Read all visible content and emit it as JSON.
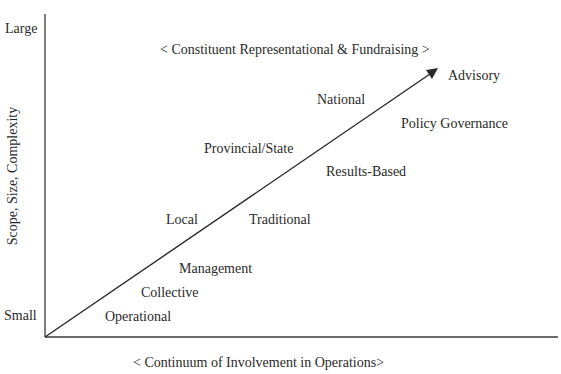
{
  "diagram": {
    "y_axis": {
      "label": "Scope, Size, Complexity",
      "top_label": "Large",
      "bottom_label": "Small"
    },
    "x_axis": {
      "label": "< Continuum of Involvement in Operations>"
    },
    "top_banner": "< Constituent Representational & Fundraising >",
    "arrow": {
      "from": "origin",
      "to": "upper-right",
      "color": "#2a2a2a"
    },
    "labels_above_arrow": [
      "Local",
      "Provincial/State",
      "National"
    ],
    "labels_below_arrow": [
      "Operational",
      "Collective",
      "Management",
      "Traditional",
      "Results-Based",
      "Policy Governance",
      "Advisory"
    ]
  },
  "labels": {
    "large": "Large",
    "small": "Small",
    "ylabel": "Scope, Size, Complexity",
    "xlabel": "< Continuum of Involvement in Operations>",
    "banner": "< Constituent Representational & Fundraising >",
    "advisory": "Advisory",
    "national": "National",
    "policy_governance": "Policy Governance",
    "provincial_state": "Provincial/State",
    "results_based": "Results-Based",
    "local": "Local",
    "traditional": "Traditional",
    "management": "Management",
    "collective": "Collective",
    "operational": "Operational"
  }
}
